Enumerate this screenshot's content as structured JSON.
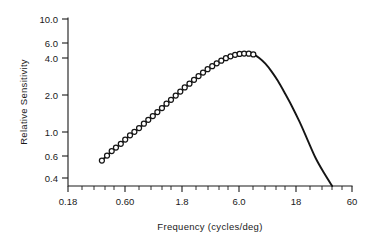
{
  "figure": {
    "background_color": "#ffffff",
    "ink_color": "#151515"
  },
  "chart_data": {
    "type": "line",
    "title": "",
    "subtitle": "",
    "xlabel": "Frequency (cycles/deg)",
    "ylabel": "Relative Sensitivity",
    "xscale": "log",
    "yscale": "log",
    "xlim": [
      0.18,
      60
    ],
    "ylim": [
      0.33,
      10.0
    ],
    "grid": false,
    "legend": null,
    "legend_position": "none",
    "xticks": [
      0.18,
      0.6,
      1.8,
      6.0,
      18,
      60
    ],
    "xtick_labels": [
      "0.18",
      "0.60",
      "1.8",
      "6.0",
      "18",
      "60"
    ],
    "yticks": [
      0.4,
      0.6,
      1.0,
      2.0,
      4.0,
      6.0,
      10.0
    ],
    "ytick_labels": [
      "0.4",
      "0.6",
      "1.0",
      "2.0",
      "4.0",
      "6.0",
      "10.0"
    ],
    "marker": "open-circle",
    "series": [
      {
        "name": "Relative Sensitivity",
        "x": [
          0.36,
          0.4,
          0.44,
          0.48,
          0.53,
          0.58,
          0.64,
          0.7,
          0.77,
          0.85,
          0.93,
          1.02,
          1.12,
          1.23,
          1.35,
          1.48,
          1.63,
          1.79,
          1.96,
          2.16,
          2.37,
          2.6,
          2.85,
          3.13,
          3.44,
          3.77,
          4.14,
          4.55,
          5.0,
          5.49,
          6.02,
          6.61,
          7.26,
          7.97
        ],
        "y": [
          0.57,
          0.63,
          0.69,
          0.74,
          0.8,
          0.87,
          0.95,
          1.02,
          1.1,
          1.2,
          1.3,
          1.4,
          1.52,
          1.65,
          1.8,
          1.95,
          2.12,
          2.3,
          2.5,
          2.7,
          2.92,
          3.15,
          3.38,
          3.62,
          3.85,
          4.08,
          4.3,
          4.52,
          4.7,
          4.84,
          4.93,
          4.97,
          4.95,
          4.88
        ]
      }
    ],
    "extrapolated_tail": {
      "description": "smooth high-frequency roll-off drawn without markers",
      "x": [
        7.97,
        9.0,
        10.2,
        11.6,
        13.2,
        15.0,
        17.5,
        20.5,
        24.0,
        28.5,
        34.0,
        40.0
      ],
      "y": [
        4.88,
        4.55,
        4.05,
        3.45,
        2.85,
        2.28,
        1.72,
        1.25,
        0.88,
        0.6,
        0.44,
        0.34
      ]
    }
  }
}
